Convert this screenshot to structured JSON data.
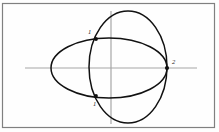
{
  "figure": {
    "background_color": "#fefefe",
    "frame": {
      "name": "figure-border",
      "x": 2.5,
      "y": 3.5,
      "width": 212,
      "height": 124,
      "stroke_color": "#808080",
      "stroke_width": 1.2
    },
    "axes": {
      "stroke_color": "#a6a6a6",
      "stroke_width": 1.2,
      "origin_x": 111,
      "origin_y": 68,
      "horizontal": {
        "label": "x-axis",
        "x1": 25,
        "y1": 68,
        "x2": 197,
        "y2": 68
      },
      "vertical": {
        "label": "y-axis",
        "x1": 111,
        "y1": 11,
        "x2": 111,
        "y2": 124
      }
    },
    "curves": [
      {
        "name": "wide-ellipse",
        "type": "ellipse",
        "cx": 109,
        "cy": 68,
        "rx": 58,
        "ry": 30,
        "stroke_color": "#111111",
        "stroke_width": 1.5,
        "fill": "none"
      },
      {
        "name": "tall-ellipse",
        "type": "ellipse",
        "cx": 128,
        "cy": 67,
        "rx": 39,
        "ry": 56,
        "stroke_color": "#111111",
        "stroke_width": 1.5,
        "fill": "none"
      }
    ],
    "points": [
      {
        "name": "upper-intersection-point",
        "label": "1",
        "cx": 96,
        "cy": 39,
        "r": 1.9,
        "color": "#111111",
        "label_x": 88,
        "label_y": 34
      },
      {
        "name": "lower-intersection-point",
        "label": "1",
        "cx": 96,
        "cy": 96,
        "r": 1.9,
        "color": "#111111",
        "label_x": 93,
        "label_y": 106
      },
      {
        "name": "right-tangency-point",
        "label": "2",
        "cx": 167,
        "cy": 68,
        "r": 2.1,
        "color": "#111111",
        "label_x": 172,
        "label_y": 64
      }
    ]
  }
}
